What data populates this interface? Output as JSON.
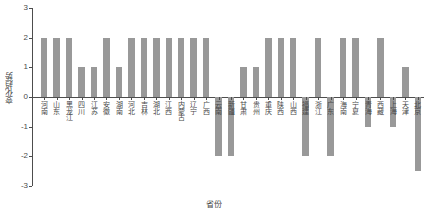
{
  "chart_data": {
    "type": "bar",
    "title": "",
    "xlabel": "省份",
    "ylabel": "变化趋势",
    "ylim": [
      -3,
      3
    ],
    "yticks": [
      3,
      2,
      1,
      0,
      -1,
      -2,
      -3
    ],
    "grid": false,
    "legend": null,
    "bar_color": "#999999",
    "axis_color": "#4d4d4d",
    "categories": [
      "河南",
      "山东",
      "黑龙江",
      "四川",
      "江苏",
      "安徽",
      "湖南",
      "河北",
      "吉林",
      "湖北",
      "江西",
      "内蒙古",
      "辽宁",
      "广西",
      "云南",
      "新疆",
      "甘肃",
      "贵州",
      "重庆",
      "陕西",
      "山西",
      "福建",
      "浙江",
      "广东",
      "海南",
      "宁夏",
      "青海",
      "西藏",
      "上海",
      "天津",
      "北京"
    ],
    "values": [
      2,
      2,
      2,
      1,
      1,
      2,
      1,
      2,
      2,
      2,
      2,
      2,
      2,
      2,
      -2,
      -2,
      1,
      1,
      2,
      2,
      2,
      -2,
      2,
      -2,
      2,
      2,
      -1,
      2,
      -1,
      1,
      -2.5
    ]
  }
}
